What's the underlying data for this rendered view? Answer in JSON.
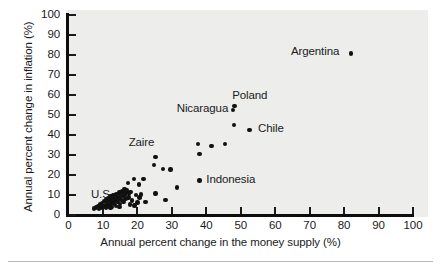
{
  "figure": {
    "background_color": "#ffffff",
    "plot_background_color": "#ededec",
    "axis_color": "#0d0d0d",
    "marker_color": "#111111",
    "text_color": "#1b1b1b"
  },
  "chart_data": {
    "type": "scatter",
    "title": "",
    "xlabel": "Annual percent change in the money supply (%)",
    "ylabel": "Annual percent change in inflation (%)",
    "xlim": [
      0,
      100
    ],
    "ylim": [
      0,
      100
    ],
    "xticks": [
      0,
      10,
      20,
      30,
      40,
      50,
      60,
      70,
      80,
      90,
      100
    ],
    "yticks": [
      0,
      10,
      20,
      30,
      40,
      50,
      60,
      70,
      80,
      90,
      100
    ],
    "xtick_labels": [
      "0",
      "10",
      "20",
      "30",
      "40",
      "50",
      "60",
      "70",
      "80",
      "90",
      "100"
    ],
    "ytick_labels": [
      "0",
      "10",
      "20",
      "30",
      "40",
      "50",
      "60",
      "70",
      "80",
      "90",
      "100"
    ],
    "grid": false,
    "legend": false,
    "marker": "filled-circle",
    "annotations": [
      {
        "text": "U.S.",
        "x": 6.5,
        "y": 9.5,
        "align": "left"
      },
      {
        "text": "Zaire",
        "x": 25.0,
        "y": 35.5,
        "align": "right"
      },
      {
        "text": "Nicaragua",
        "x": 46.5,
        "y": 52.5,
        "align": "right"
      },
      {
        "text": "Poland",
        "x": 47.5,
        "y": 59.0,
        "align": "left"
      },
      {
        "text": "Chile",
        "x": 55.0,
        "y": 42.5,
        "align": "left"
      },
      {
        "text": "Argentina",
        "x": 78.5,
        "y": 81.0,
        "align": "right"
      },
      {
        "text": "Indonesia",
        "x": 40.0,
        "y": 17.0,
        "align": "left"
      }
    ],
    "points": [
      {
        "x": 82.0,
        "y": 80.5,
        "label": "Argentina"
      },
      {
        "x": 48.2,
        "y": 54.5,
        "label": "Poland"
      },
      {
        "x": 47.8,
        "y": 52.5,
        "label": "Nicaragua"
      },
      {
        "x": 48.0,
        "y": 45.0,
        "label": ""
      },
      {
        "x": 52.5,
        "y": 42.5,
        "label": "Chile"
      },
      {
        "x": 37.6,
        "y": 35.5,
        "label": "Zaire"
      },
      {
        "x": 41.5,
        "y": 34.3,
        "label": ""
      },
      {
        "x": 45.5,
        "y": 35.3,
        "label": ""
      },
      {
        "x": 38.0,
        "y": 30.5,
        "label": ""
      },
      {
        "x": 25.3,
        "y": 28.8,
        "label": ""
      },
      {
        "x": 24.8,
        "y": 25.0,
        "label": ""
      },
      {
        "x": 27.4,
        "y": 22.8,
        "label": ""
      },
      {
        "x": 29.6,
        "y": 22.7,
        "label": ""
      },
      {
        "x": 19.0,
        "y": 18.0,
        "label": ""
      },
      {
        "x": 21.8,
        "y": 18.0,
        "label": ""
      },
      {
        "x": 38.0,
        "y": 17.2,
        "label": "Indonesia"
      },
      {
        "x": 17.2,
        "y": 16.0,
        "label": ""
      },
      {
        "x": 20.5,
        "y": 15.2,
        "label": ""
      },
      {
        "x": 31.5,
        "y": 13.7,
        "label": ""
      },
      {
        "x": 16.2,
        "y": 13.0,
        "label": ""
      },
      {
        "x": 17.0,
        "y": 12.6,
        "label": ""
      },
      {
        "x": 15.6,
        "y": 12.0,
        "label": ""
      },
      {
        "x": 16.8,
        "y": 11.8,
        "label": ""
      },
      {
        "x": 18.0,
        "y": 11.5,
        "label": ""
      },
      {
        "x": 14.8,
        "y": 11.3,
        "label": ""
      },
      {
        "x": 15.9,
        "y": 11.0,
        "label": ""
      },
      {
        "x": 17.6,
        "y": 10.8,
        "label": ""
      },
      {
        "x": 25.2,
        "y": 10.8,
        "label": ""
      },
      {
        "x": 13.8,
        "y": 10.6,
        "label": ""
      },
      {
        "x": 14.4,
        "y": 10.4,
        "label": ""
      },
      {
        "x": 16.4,
        "y": 10.2,
        "label": ""
      },
      {
        "x": 19.6,
        "y": 10.0,
        "label": ""
      },
      {
        "x": 12.9,
        "y": 9.9,
        "label": ""
      },
      {
        "x": 13.4,
        "y": 9.7,
        "label": ""
      },
      {
        "x": 15.2,
        "y": 9.6,
        "label": ""
      },
      {
        "x": 16.0,
        "y": 9.4,
        "label": ""
      },
      {
        "x": 12.2,
        "y": 9.2,
        "label": ""
      },
      {
        "x": 14.0,
        "y": 9.0,
        "label": ""
      },
      {
        "x": 15.0,
        "y": 8.9,
        "label": ""
      },
      {
        "x": 17.4,
        "y": 8.7,
        "label": ""
      },
      {
        "x": 11.6,
        "y": 8.5,
        "label": ""
      },
      {
        "x": 13.0,
        "y": 8.4,
        "label": ""
      },
      {
        "x": 14.6,
        "y": 8.2,
        "label": ""
      },
      {
        "x": 16.6,
        "y": 8.0,
        "label": ""
      },
      {
        "x": 11.0,
        "y": 7.8,
        "label": ""
      },
      {
        "x": 12.5,
        "y": 7.7,
        "label": ""
      },
      {
        "x": 13.6,
        "y": 7.5,
        "label": ""
      },
      {
        "x": 15.4,
        "y": 7.4,
        "label": ""
      },
      {
        "x": 18.4,
        "y": 7.2,
        "label": ""
      },
      {
        "x": 10.4,
        "y": 7.0,
        "label": ""
      },
      {
        "x": 11.8,
        "y": 6.9,
        "label": ""
      },
      {
        "x": 12.8,
        "y": 6.7,
        "label": ""
      },
      {
        "x": 14.2,
        "y": 6.6,
        "label": ""
      },
      {
        "x": 16.0,
        "y": 6.4,
        "label": ""
      },
      {
        "x": 20.0,
        "y": 6.3,
        "label": ""
      },
      {
        "x": 9.8,
        "y": 6.1,
        "label": ""
      },
      {
        "x": 11.2,
        "y": 6.0,
        "label": ""
      },
      {
        "x": 12.4,
        "y": 5.8,
        "label": ""
      },
      {
        "x": 13.2,
        "y": 5.7,
        "label": ""
      },
      {
        "x": 15.0,
        "y": 5.5,
        "label": ""
      },
      {
        "x": 17.8,
        "y": 5.3,
        "label": ""
      },
      {
        "x": 9.2,
        "y": 5.2,
        "label": ""
      },
      {
        "x": 10.6,
        "y": 5.0,
        "label": ""
      },
      {
        "x": 11.4,
        "y": 4.9,
        "label": ""
      },
      {
        "x": 12.0,
        "y": 4.7,
        "label": ""
      },
      {
        "x": 13.8,
        "y": 4.6,
        "label": ""
      },
      {
        "x": 8.6,
        "y": 4.4,
        "label": ""
      },
      {
        "x": 10.0,
        "y": 4.3,
        "label": ""
      },
      {
        "x": 11.0,
        "y": 4.1,
        "label": ""
      },
      {
        "x": 12.6,
        "y": 4.0,
        "label": ""
      },
      {
        "x": 14.8,
        "y": 3.9,
        "label": ""
      },
      {
        "x": 8.0,
        "y": 3.8,
        "label": ""
      },
      {
        "x": 9.4,
        "y": 3.6,
        "label": ""
      },
      {
        "x": 10.8,
        "y": 3.5,
        "label": ""
      },
      {
        "x": 12.2,
        "y": 3.4,
        "label": ""
      },
      {
        "x": 7.4,
        "y": 3.3,
        "label": ""
      },
      {
        "x": 8.8,
        "y": 3.2,
        "label": ""
      },
      {
        "x": 20.6,
        "y": 8.8,
        "label": ""
      },
      {
        "x": 21.0,
        "y": 10.3,
        "label": ""
      },
      {
        "x": 19.2,
        "y": 4.8,
        "label": ""
      },
      {
        "x": 22.4,
        "y": 6.4,
        "label": ""
      },
      {
        "x": 28.2,
        "y": 7.4,
        "label": ""
      }
    ]
  }
}
